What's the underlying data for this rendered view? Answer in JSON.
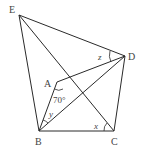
{
  "diagram": {
    "type": "geometry",
    "points": {
      "E": {
        "label": "E",
        "x": 19,
        "y": 15
      },
      "D": {
        "label": "D",
        "x": 125,
        "y": 56
      },
      "A": {
        "label": "A",
        "x": 57,
        "y": 82
      },
      "B": {
        "label": "B",
        "x": 39,
        "y": 131
      },
      "C": {
        "label": "C",
        "x": 114,
        "y": 131
      }
    },
    "segments": [
      "EB",
      "ED",
      "EC",
      "AD",
      "AB",
      "BC",
      "BD",
      "CD"
    ],
    "angle_labels": {
      "angle_A": "70°",
      "x": "x",
      "y": "y",
      "z": "z"
    }
  }
}
